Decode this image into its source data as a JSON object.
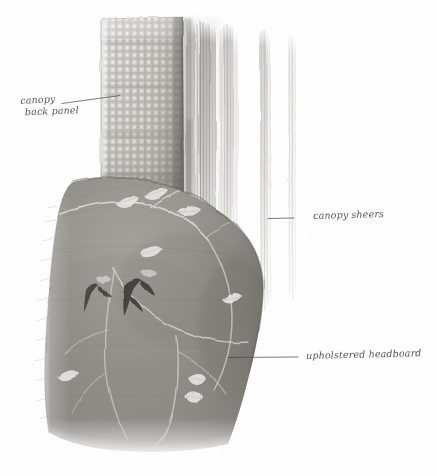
{
  "drawing": {
    "title": "Canopy bed interior sketch",
    "medium": "graphite pencil rendering on white paper",
    "canvas": {
      "width": 437,
      "height": 476,
      "background": "#ffffff"
    }
  },
  "annotations": [
    {
      "id": "canopy-back-panel",
      "text_line_1": "canopy",
      "text_line_2": "back panel",
      "full_text": "canopy back panel",
      "label_x": 20,
      "label_y": 95,
      "leader_from_x": 62,
      "leader_from_y": 103,
      "leader_to_x": 120,
      "leader_to_y": 95,
      "ink_color": "#4a4742"
    },
    {
      "id": "canopy-sheers",
      "text_line_1": "canopy sheers",
      "text_line_2": "",
      "full_text": "canopy sheers",
      "label_x": 313,
      "label_y": 210,
      "leader_from_x": 294,
      "leader_from_y": 218,
      "leader_to_x": 268,
      "leader_to_y": 218,
      "ink_color": "#4a4742"
    },
    {
      "id": "upholstered-headboard",
      "text_line_1": "upholstered headboard",
      "text_line_2": "",
      "full_text": "upholstered headboard",
      "label_x": 306,
      "label_y": 350,
      "leader_from_x": 298,
      "leader_from_y": 357,
      "leader_to_x": 228,
      "leader_to_y": 357,
      "ink_color": "#4a4742"
    }
  ],
  "elements": {
    "canopy_back_panel": {
      "name": "canopy back panel",
      "description": "woven grid-textured fabric panel behind the bed",
      "x": 100,
      "y": 18,
      "width": 84,
      "height": 190,
      "base_color": "#c9c6c1",
      "shadow_color": "#8e8b86",
      "weave": "basket grid"
    },
    "canopy_sheers": {
      "name": "canopy sheers",
      "description": "vertical translucent sheer curtain panels drawn with long pencil strokes",
      "panels": [
        {
          "x": 190,
          "width": 26,
          "top": 22,
          "bottom": 330,
          "tone": "#a9a7a3"
        },
        {
          "x": 222,
          "width": 22,
          "top": 26,
          "bottom": 318,
          "tone": "#bcbab6"
        },
        {
          "x": 262,
          "width": 14,
          "top": 30,
          "bottom": 316,
          "tone": "#b6b4b0"
        },
        {
          "x": 288,
          "width": 10,
          "top": 34,
          "bottom": 300,
          "tone": "#cbc9c6"
        }
      ]
    },
    "upholstered_headboard": {
      "name": "upholstered headboard",
      "description": "large rounded upholstered headboard with embroidered vine and leaf motif",
      "x": 44,
      "y": 178,
      "width": 220,
      "height": 270,
      "base_color": "#8c8984",
      "highlight_color": "#eceae7",
      "motif": "trailing vine with leaves and dark bud accents"
    }
  },
  "motifs": {
    "dark_bud_count": 2,
    "light_leaf_count": 9,
    "vine_branch_count": 6
  },
  "palette": {
    "paper": "#ffffff",
    "graphite_light": "#d6d4d1",
    "graphite_mid": "#9b9894",
    "graphite_dark": "#5d5a56",
    "ink": "#4a4742"
  }
}
